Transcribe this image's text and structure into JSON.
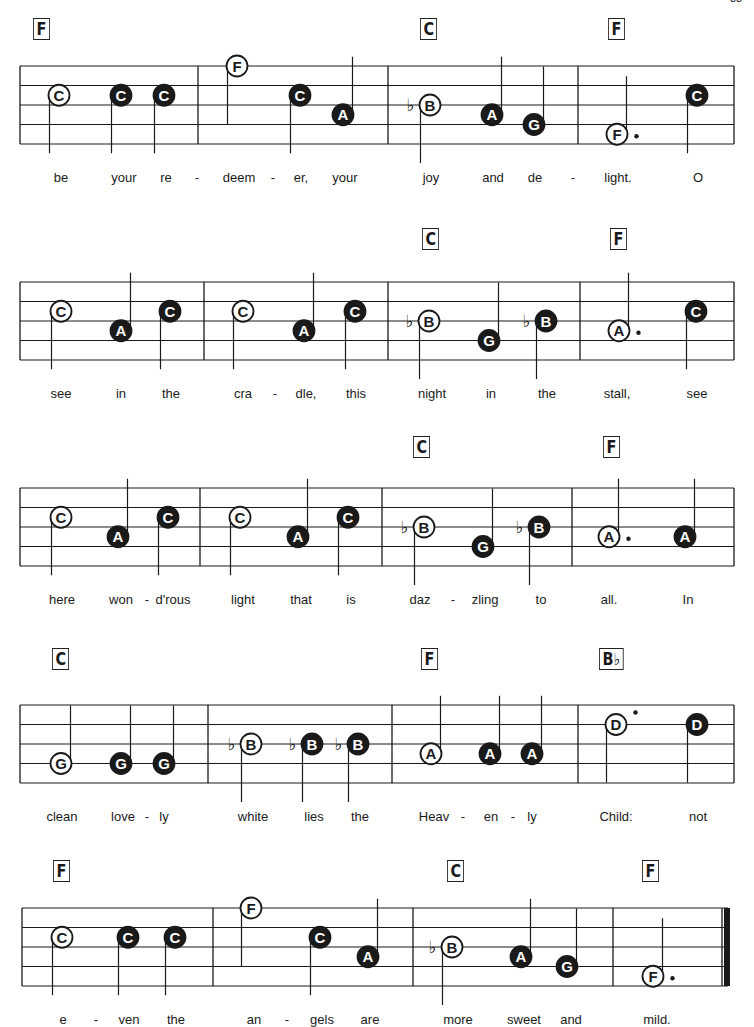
{
  "page_number": "33",
  "systems": [
    {
      "top": 18,
      "staff_top": 48,
      "staff_left": 20,
      "staff_right": 734,
      "barlines": [
        20,
        198,
        388,
        578,
        734
      ],
      "final_bar": false,
      "chords": [
        {
          "label": "F",
          "x": 33
        },
        {
          "label": "C",
          "x": 420
        },
        {
          "label": "F",
          "x": 608
        }
      ],
      "notes": [
        {
          "name": "C",
          "x": 59,
          "pos": 1.5,
          "filled": false,
          "stem": "down"
        },
        {
          "name": "C",
          "x": 121,
          "pos": 1.5,
          "filled": true,
          "stem": "down"
        },
        {
          "name": "C",
          "x": 164,
          "pos": 1.5,
          "filled": true,
          "stem": "down"
        },
        {
          "name": "F",
          "x": 237,
          "pos": 0,
          "filled": false,
          "stem": "down"
        },
        {
          "name": "C",
          "x": 300,
          "pos": 1.5,
          "filled": true,
          "stem": "down"
        },
        {
          "name": "A",
          "x": 343,
          "pos": 2.5,
          "filled": true,
          "stem": "up"
        },
        {
          "name": "B",
          "x": 430,
          "pos": 2,
          "filled": false,
          "stem": "down",
          "flat": true
        },
        {
          "name": "A",
          "x": 492,
          "pos": 2.5,
          "filled": true,
          "stem": "up"
        },
        {
          "name": "G",
          "x": 534,
          "pos": 3,
          "filled": true,
          "stem": "up"
        },
        {
          "name": "F",
          "x": 617,
          "pos": 3.5,
          "filled": false,
          "stem": "up",
          "dot": true
        },
        {
          "name": "C",
          "x": 697,
          "pos": 1.5,
          "filled": true,
          "stem": "down"
        }
      ],
      "lyrics": [
        {
          "text": "be",
          "x": 61
        },
        {
          "text": "your",
          "x": 124
        },
        {
          "text": "re",
          "x": 166
        },
        {
          "text": "-",
          "x": 197
        },
        {
          "text": "deem",
          "x": 239
        },
        {
          "text": "-",
          "x": 273
        },
        {
          "text": "er,",
          "x": 301
        },
        {
          "text": "your",
          "x": 345
        },
        {
          "text": "joy",
          "x": 431
        },
        {
          "text": "and",
          "x": 493
        },
        {
          "text": "de",
          "x": 535
        },
        {
          "text": "-",
          "x": 573
        },
        {
          "text": "light.",
          "x": 618
        },
        {
          "text": "O",
          "x": 698
        }
      ]
    },
    {
      "top": 228,
      "staff_top": 54,
      "staff_left": 20,
      "staff_right": 734,
      "barlines": [
        20,
        204,
        388,
        580,
        734
      ],
      "final_bar": false,
      "chords": [
        {
          "label": "C",
          "x": 422
        },
        {
          "label": "F",
          "x": 610
        }
      ],
      "notes": [
        {
          "name": "C",
          "x": 61,
          "pos": 1.5,
          "filled": false,
          "stem": "down"
        },
        {
          "name": "A",
          "x": 121,
          "pos": 2.5,
          "filled": true,
          "stem": "up"
        },
        {
          "name": "C",
          "x": 170,
          "pos": 1.5,
          "filled": true,
          "stem": "down"
        },
        {
          "name": "C",
          "x": 243,
          "pos": 1.5,
          "filled": false,
          "stem": "down"
        },
        {
          "name": "A",
          "x": 304,
          "pos": 2.5,
          "filled": true,
          "stem": "up"
        },
        {
          "name": "C",
          "x": 355,
          "pos": 1.5,
          "filled": true,
          "stem": "down"
        },
        {
          "name": "B",
          "x": 429,
          "pos": 2,
          "filled": false,
          "stem": "down",
          "flat": true
        },
        {
          "name": "G",
          "x": 489,
          "pos": 3,
          "filled": true,
          "stem": "up"
        },
        {
          "name": "B",
          "x": 546,
          "pos": 2,
          "filled": true,
          "stem": "down",
          "flat": true
        },
        {
          "name": "A",
          "x": 619,
          "pos": 2.5,
          "filled": false,
          "stem": "up",
          "dot": true
        },
        {
          "name": "C",
          "x": 696,
          "pos": 1.5,
          "filled": true,
          "stem": "down"
        }
      ],
      "lyrics": [
        {
          "text": "see",
          "x": 61
        },
        {
          "text": "in",
          "x": 121
        },
        {
          "text": "the",
          "x": 171
        },
        {
          "text": "cra",
          "x": 243
        },
        {
          "text": "-",
          "x": 275
        },
        {
          "text": "dle,",
          "x": 306
        },
        {
          "text": "this",
          "x": 356
        },
        {
          "text": "night",
          "x": 432
        },
        {
          "text": "in",
          "x": 491
        },
        {
          "text": "the",
          "x": 547
        },
        {
          "text": "stall,",
          "x": 617
        },
        {
          "text": "see",
          "x": 697
        }
      ]
    },
    {
      "top": 436,
      "staff_top": 52,
      "staff_left": 20,
      "staff_right": 734,
      "barlines": [
        20,
        200,
        382,
        572,
        734
      ],
      "final_bar": false,
      "chords": [
        {
          "label": "C",
          "x": 413
        },
        {
          "label": "F",
          "x": 603
        }
      ],
      "notes": [
        {
          "name": "C",
          "x": 61,
          "pos": 1.5,
          "filled": false,
          "stem": "down"
        },
        {
          "name": "A",
          "x": 118,
          "pos": 2.5,
          "filled": true,
          "stem": "up"
        },
        {
          "name": "C",
          "x": 168,
          "pos": 1.5,
          "filled": true,
          "stem": "down"
        },
        {
          "name": "C",
          "x": 240,
          "pos": 1.5,
          "filled": false,
          "stem": "down"
        },
        {
          "name": "A",
          "x": 298,
          "pos": 2.5,
          "filled": true,
          "stem": "up"
        },
        {
          "name": "C",
          "x": 348,
          "pos": 1.5,
          "filled": true,
          "stem": "down"
        },
        {
          "name": "B",
          "x": 424,
          "pos": 2,
          "filled": false,
          "stem": "down",
          "flat": true
        },
        {
          "name": "G",
          "x": 483,
          "pos": 3,
          "filled": true,
          "stem": "up"
        },
        {
          "name": "B",
          "x": 539,
          "pos": 2,
          "filled": true,
          "stem": "down",
          "flat": true
        },
        {
          "name": "A",
          "x": 609,
          "pos": 2.5,
          "filled": false,
          "stem": "up",
          "dot": true
        },
        {
          "name": "A",
          "x": 685,
          "pos": 2.5,
          "filled": true,
          "stem": "up"
        }
      ],
      "lyrics": [
        {
          "text": "here",
          "x": 62
        },
        {
          "text": "won",
          "x": 121
        },
        {
          "text": "-",
          "x": 147
        },
        {
          "text": "d'rous",
          "x": 173
        },
        {
          "text": "light",
          "x": 243
        },
        {
          "text": "that",
          "x": 301
        },
        {
          "text": "is",
          "x": 351
        },
        {
          "text": "daz",
          "x": 420
        },
        {
          "text": "-",
          "x": 453
        },
        {
          "text": "zling",
          "x": 485
        },
        {
          "text": "to",
          "x": 541
        },
        {
          "text": "all.",
          "x": 609
        },
        {
          "text": "In",
          "x": 688
        }
      ]
    },
    {
      "top": 648,
      "staff_top": 57,
      "staff_left": 20,
      "staff_right": 734,
      "barlines": [
        20,
        208,
        392,
        578,
        734
      ],
      "final_bar": false,
      "chords": [
        {
          "label": "C",
          "x": 52
        },
        {
          "label": "F",
          "x": 421
        },
        {
          "label": "B♭",
          "x": 599
        }
      ],
      "notes": [
        {
          "name": "G",
          "x": 61,
          "pos": 3,
          "filled": false,
          "stem": "up"
        },
        {
          "name": "G",
          "x": 121,
          "pos": 3,
          "filled": true,
          "stem": "up"
        },
        {
          "name": "G",
          "x": 164,
          "pos": 3,
          "filled": true,
          "stem": "up"
        },
        {
          "name": "B",
          "x": 251,
          "pos": 2,
          "filled": false,
          "stem": "down",
          "flat": true
        },
        {
          "name": "B",
          "x": 312,
          "pos": 2,
          "filled": true,
          "stem": "down",
          "flat": true
        },
        {
          "name": "B",
          "x": 358,
          "pos": 2,
          "filled": true,
          "stem": "down",
          "flat": true
        },
        {
          "name": "A",
          "x": 431,
          "pos": 2.5,
          "filled": false,
          "stem": "up"
        },
        {
          "name": "A",
          "x": 490,
          "pos": 2.5,
          "filled": true,
          "stem": "up"
        },
        {
          "name": "A",
          "x": 532,
          "pos": 2.5,
          "filled": true,
          "stem": "up"
        },
        {
          "name": "D",
          "x": 616,
          "pos": 1,
          "filled": false,
          "stem": "down",
          "dot": true,
          "dot_high": true
        },
        {
          "name": "D",
          "x": 697,
          "pos": 1,
          "filled": true,
          "stem": "down"
        }
      ],
      "lyrics": [
        {
          "text": "clean",
          "x": 62
        },
        {
          "text": "love",
          "x": 123
        },
        {
          "text": "-",
          "x": 147
        },
        {
          "text": "ly",
          "x": 164
        },
        {
          "text": "white",
          "x": 253
        },
        {
          "text": "lies",
          "x": 314
        },
        {
          "text": "the",
          "x": 360
        },
        {
          "text": "Heav",
          "x": 434
        },
        {
          "text": "-",
          "x": 463
        },
        {
          "text": "en",
          "x": 491
        },
        {
          "text": "-",
          "x": 513
        },
        {
          "text": "ly",
          "x": 532
        },
        {
          "text": "Child:",
          "x": 616
        },
        {
          "text": "not",
          "x": 698
        }
      ]
    },
    {
      "top": 860,
      "staff_top": 48,
      "staff_left": 22,
      "staff_right": 728,
      "barlines": [
        22,
        213,
        413,
        613,
        722
      ],
      "final_bar": true,
      "chords": [
        {
          "label": "F",
          "x": 53
        },
        {
          "label": "C",
          "x": 447
        },
        {
          "label": "F",
          "x": 642
        }
      ],
      "notes": [
        {
          "name": "C",
          "x": 62,
          "pos": 1.5,
          "filled": false,
          "stem": "down"
        },
        {
          "name": "C",
          "x": 128,
          "pos": 1.5,
          "filled": true,
          "stem": "down"
        },
        {
          "name": "C",
          "x": 175,
          "pos": 1.5,
          "filled": true,
          "stem": "down"
        },
        {
          "name": "F",
          "x": 251,
          "pos": 0,
          "filled": false,
          "stem": "down"
        },
        {
          "name": "C",
          "x": 320,
          "pos": 1.5,
          "filled": true,
          "stem": "down"
        },
        {
          "name": "A",
          "x": 368,
          "pos": 2.5,
          "filled": true,
          "stem": "up"
        },
        {
          "name": "B",
          "x": 452,
          "pos": 2,
          "filled": false,
          "stem": "down",
          "flat": true
        },
        {
          "name": "A",
          "x": 521,
          "pos": 2.5,
          "filled": true,
          "stem": "up"
        },
        {
          "name": "G",
          "x": 567,
          "pos": 3,
          "filled": true,
          "stem": "up"
        },
        {
          "name": "F",
          "x": 653,
          "pos": 3.5,
          "filled": false,
          "stem": "up",
          "dot": true
        }
      ],
      "lyrics": [
        {
          "text": "e",
          "x": 63
        },
        {
          "text": "-",
          "x": 96
        },
        {
          "text": "ven",
          "x": 129
        },
        {
          "text": "the",
          "x": 176
        },
        {
          "text": "an",
          "x": 254
        },
        {
          "text": "-",
          "x": 287
        },
        {
          "text": "gels",
          "x": 322
        },
        {
          "text": "are",
          "x": 370
        },
        {
          "text": "more",
          "x": 458
        },
        {
          "text": "sweet",
          "x": 524
        },
        {
          "text": "and",
          "x": 571
        },
        {
          "text": "mild.",
          "x": 657
        }
      ]
    }
  ],
  "style": {
    "ink": "#1a1a1a",
    "line_spacing": 19.5,
    "note_radius": 10.5
  }
}
